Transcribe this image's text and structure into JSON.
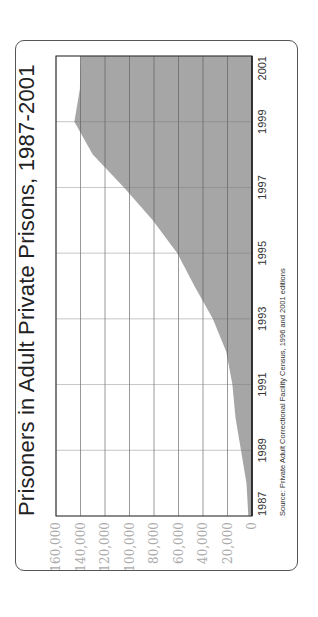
{
  "chart_data": {
    "type": "area",
    "title": "Prisoners in Adult Private Prisons, 1987-2001",
    "xlabel": "",
    "ylabel": "",
    "x": [
      1987,
      1988,
      1989,
      1990,
      1991,
      1992,
      1993,
      1994,
      1995,
      1996,
      1997,
      1998,
      1999,
      2000,
      2001
    ],
    "values": [
      3000,
      4500,
      9000,
      13500,
      16000,
      21000,
      32000,
      47000,
      61000,
      81000,
      104500,
      130000,
      145000,
      140500,
      140000
    ],
    "series": [
      {
        "name": "Prisoners in adult private prisons",
        "values": [
          3000,
          4500,
          9000,
          13500,
          16000,
          21000,
          32000,
          47000,
          61000,
          81000,
          104500,
          130000,
          145000,
          140500,
          140000
        ]
      }
    ],
    "xticks": [
      "1987",
      "1989",
      "1991",
      "1993",
      "1995",
      "1997",
      "1999",
      "2001"
    ],
    "yticks": [
      "0",
      "20,000",
      "40,000",
      "60,000",
      "80,000",
      "100,000",
      "120,000",
      "140,000",
      "160,000"
    ],
    "ylim": [
      0,
      160000
    ],
    "xlim": [
      1987,
      2001
    ],
    "grid": true,
    "legend": "none",
    "orientation": "rotated 90° counter-clockwise",
    "fill_color": "#a6a6a6",
    "source": "Source: Private Adult Correctional Facility Census, 1996 and 2001 editions"
  },
  "labels": {
    "title": "Prisoners in Adult Private Prisons, 1987-2001",
    "source": "Source: Private Adult Correctional Facility Census, 1996 and 2001 editions"
  }
}
